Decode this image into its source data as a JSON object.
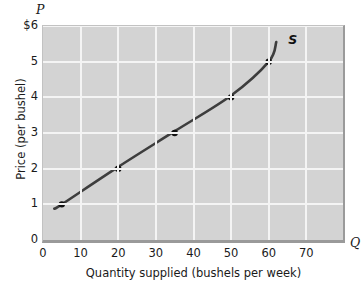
{
  "chart_data": {
    "type": "line",
    "title": "",
    "xlabel": "Quantity supplied (bushels per week)",
    "ylabel": "Price (per bushel)",
    "x_axis_symbol": "Q",
    "y_axis_symbol": "P",
    "xlim": [
      0,
      80
    ],
    "ylim": [
      0,
      6
    ],
    "grid": true,
    "legend": "none",
    "xticks": [
      {
        "value": 0,
        "label": "0"
      },
      {
        "value": 10,
        "label": "10"
      },
      {
        "value": 20,
        "label": "20"
      },
      {
        "value": 30,
        "label": "30"
      },
      {
        "value": 40,
        "label": "40"
      },
      {
        "value": 50,
        "label": "50"
      },
      {
        "value": 60,
        "label": "60"
      },
      {
        "value": 70,
        "label": "70"
      }
    ],
    "yticks": [
      {
        "value": 0,
        "label": "0"
      },
      {
        "value": 1,
        "label": "1"
      },
      {
        "value": 2,
        "label": "2"
      },
      {
        "value": 3,
        "label": "3"
      },
      {
        "value": 4,
        "label": "4"
      },
      {
        "value": 5,
        "label": "5"
      },
      {
        "value": 6,
        "label": "$6"
      }
    ],
    "series": [
      {
        "name": "S",
        "label": "S",
        "color": "#3d3d3d",
        "marker_color": "#111111",
        "x": [
          3,
          5,
          20,
          35,
          50,
          60,
          62
        ],
        "y": [
          0.88,
          1.0,
          2.05,
          3.05,
          4.05,
          5.0,
          5.55
        ],
        "marked_points": [
          {
            "x": 5,
            "y": 1
          },
          {
            "x": 20,
            "y": 2
          },
          {
            "x": 35,
            "y": 3
          },
          {
            "x": 50,
            "y": 4
          },
          {
            "x": 60,
            "y": 5
          }
        ]
      }
    ]
  }
}
